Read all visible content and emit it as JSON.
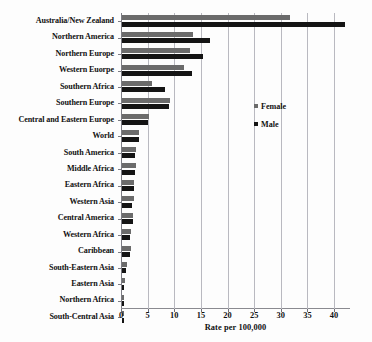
{
  "chart_data": {
    "type": "bar",
    "orientation": "horizontal",
    "title": "",
    "xlabel": "Rate per 100,000",
    "ylabel": "",
    "xlim": [
      0,
      43
    ],
    "xticks": [
      0,
      5,
      10,
      15,
      20,
      25,
      30,
      35,
      40
    ],
    "grid": "vertical",
    "legend_position": "inside-right",
    "categories": [
      "Australia/New Zealand",
      "Northern America",
      "Northern Europe",
      "Western Euorpe",
      "Southern Africa",
      "Southern Europe",
      "Central and Eastern Europe",
      "World",
      "South America",
      "Middle Africa",
      "Eastern Africa",
      "Western Asia",
      "Central America",
      "Western Africa",
      "Caribbean",
      "South-Eastern Asia",
      "Eastern Asia",
      "Northern Africa",
      "South-Central Asia"
    ],
    "series": [
      {
        "name": "Female",
        "color": "#6b6b6b",
        "values": [
          31.6,
          13.4,
          12.8,
          11.6,
          5.6,
          9.0,
          5.1,
          3.2,
          2.7,
          2.6,
          2.3,
          2.2,
          2.1,
          1.6,
          1.6,
          0.9,
          0.5,
          0.4,
          0.3
        ]
      },
      {
        "name": "Male",
        "color": "#141414",
        "values": [
          41.8,
          16.5,
          15.2,
          13.1,
          8.1,
          8.9,
          4.8,
          3.1,
          2.5,
          2.4,
          2.2,
          1.8,
          2.0,
          1.5,
          1.5,
          0.8,
          0.4,
          0.4,
          0.3
        ]
      }
    ]
  },
  "legend": {
    "items": [
      {
        "label": "Female",
        "key": "female"
      },
      {
        "label": "Male",
        "key": "male"
      }
    ]
  }
}
